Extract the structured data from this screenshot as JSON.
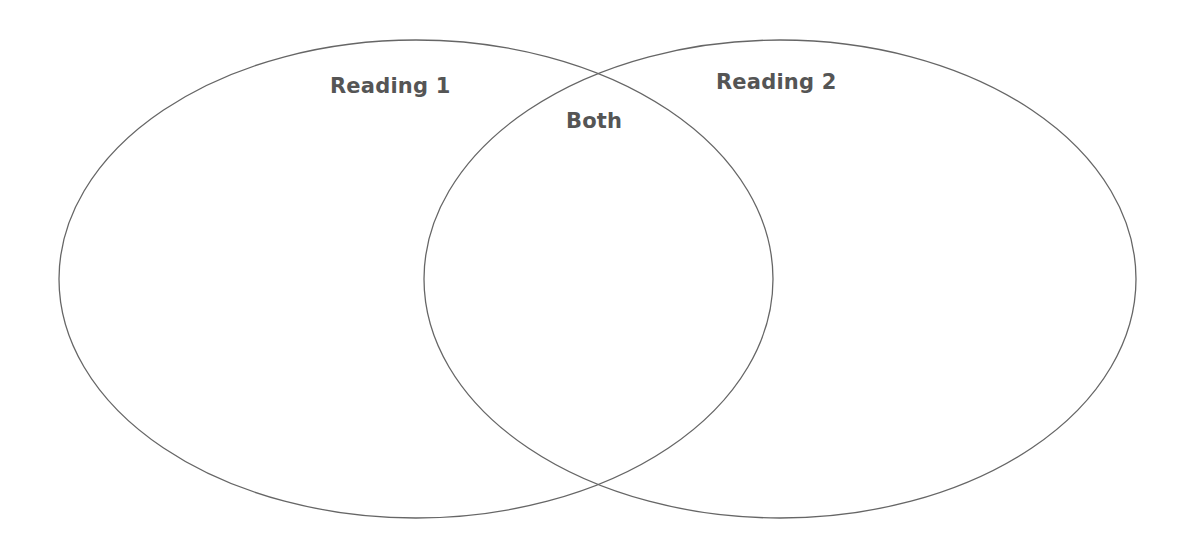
{
  "diagram": {
    "type": "venn",
    "sets": [
      {
        "id": "reading-1",
        "label": "Reading 1",
        "ellipse": {
          "cx": 416,
          "cy": 279,
          "rx": 357,
          "ry": 239
        }
      },
      {
        "id": "reading-2",
        "label": "Reading 2",
        "ellipse": {
          "cx": 780,
          "cy": 279,
          "rx": 356,
          "ry": 239
        }
      }
    ],
    "intersection": {
      "label": "Both"
    },
    "colors": {
      "stroke": "#666666",
      "text": "#555555",
      "background": "#ffffff"
    }
  }
}
